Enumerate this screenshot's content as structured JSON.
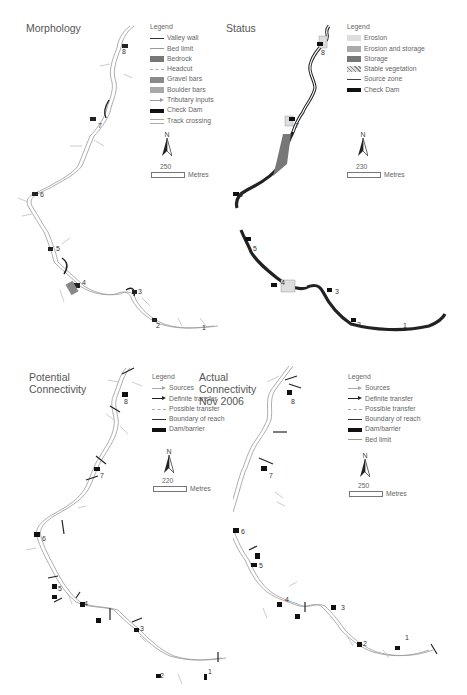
{
  "figure": {
    "panels": [
      {
        "id": "morphology",
        "title": "Morphology",
        "legend": {
          "title": "Legend",
          "items": [
            {
              "label": "Valley wall",
              "symbol": "line",
              "color": "#333333"
            },
            {
              "label": "Bed limit",
              "symbol": "thin",
              "color": "#999999"
            },
            {
              "label": "Bedrock",
              "symbol": "fill",
              "color": "#777777"
            },
            {
              "label": "Headcut",
              "symbol": "dash",
              "color": "#aaaaaa"
            },
            {
              "label": "Gravel bars",
              "symbol": "fill",
              "color": "#8a8a8a"
            },
            {
              "label": "Boulder bars",
              "symbol": "fill",
              "color": "#a8a8a8"
            },
            {
              "label": "Tributary inputs",
              "symbol": "arrow",
              "color": "#999999"
            },
            {
              "label": "Check Dam",
              "symbol": "dam",
              "color": "#111111"
            },
            {
              "label": "Track crossing",
              "symbol": "track",
              "color": "#aaaaaa"
            }
          ]
        },
        "north_label": "N",
        "scale": {
          "value": "250",
          "unit": "Metres"
        },
        "reach_labels": [
          "8",
          "7",
          "6",
          "5",
          "4",
          "3",
          "2",
          "1"
        ]
      },
      {
        "id": "status",
        "title": "Status",
        "legend": {
          "title": "Legend",
          "items": [
            {
              "label": "Erosion",
              "symbol": "fill",
              "color": "#dddddd"
            },
            {
              "label": "Erosion and storage",
              "symbol": "fill",
              "color": "#aaaaaa"
            },
            {
              "label": "Storage",
              "symbol": "fill",
              "color": "#777777"
            },
            {
              "label": "Stable vegetation",
              "symbol": "hatch",
              "color": "#888888"
            },
            {
              "label": "Source zone",
              "symbol": "line",
              "color": "#444444"
            },
            {
              "label": "Check Dam",
              "symbol": "dam",
              "color": "#111111"
            }
          ]
        },
        "north_label": "N",
        "scale": {
          "value": "230",
          "unit": "Metres"
        },
        "reach_labels": [
          "8",
          "7",
          "6",
          "5",
          "4",
          "3",
          "2",
          "1"
        ]
      },
      {
        "id": "potential-connectivity",
        "title": "Potential\nConnectivity",
        "legend": {
          "title": "Legend",
          "items": [
            {
              "label": "Sources",
              "symbol": "arrow",
              "color": "#aaaaaa"
            },
            {
              "label": "Definite transfer",
              "symbol": "arrow",
              "color": "#222222"
            },
            {
              "label": "Possible transfer",
              "symbol": "dash",
              "color": "#aaaaaa"
            },
            {
              "label": "Boundary of reach",
              "symbol": "line",
              "color": "#333333"
            },
            {
              "label": "Dam/barrier",
              "symbol": "dam",
              "color": "#111111"
            }
          ]
        },
        "north_label": "N",
        "scale": {
          "value": "220",
          "unit": "Metres"
        },
        "reach_labels": [
          "8",
          "7",
          "6",
          "5",
          "4",
          "3",
          "2",
          "1"
        ]
      },
      {
        "id": "actual-connectivity",
        "title": "Actual\nConnectivity\nNov 2006",
        "legend": {
          "title": "Legend",
          "items": [
            {
              "label": "Sources",
              "symbol": "arrow",
              "color": "#aaaaaa"
            },
            {
              "label": "Definite transfer",
              "symbol": "arrow",
              "color": "#222222"
            },
            {
              "label": "Possible transfer",
              "symbol": "dash",
              "color": "#aaaaaa"
            },
            {
              "label": "Boundary of reach",
              "symbol": "line",
              "color": "#333333"
            },
            {
              "label": "Dam/barrier",
              "symbol": "dam",
              "color": "#111111"
            },
            {
              "label": "Bed limit",
              "symbol": "thin",
              "color": "#999999"
            }
          ]
        },
        "north_label": "N",
        "scale": {
          "value": "250",
          "unit": "Metres"
        },
        "reach_labels": [
          "8",
          "7",
          "6",
          "5",
          "4",
          "3",
          "2",
          "1"
        ]
      }
    ]
  }
}
